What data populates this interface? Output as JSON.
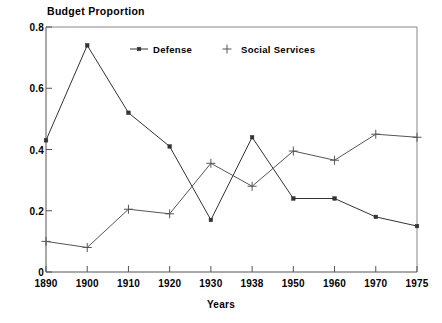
{
  "chart_data": {
    "type": "line",
    "title": "",
    "xlabel": "Years",
    "ylabel": "Budget Proportion",
    "categories": [
      "1890",
      "1900",
      "1910",
      "1920",
      "1930",
      "1938",
      "1950",
      "1960",
      "1970",
      "1975"
    ],
    "series": [
      {
        "name": "Defense",
        "marker": "square-dot",
        "color": "#333333",
        "values": [
          0.43,
          0.74,
          0.52,
          0.41,
          0.17,
          0.44,
          0.24,
          0.24,
          0.18,
          0.15
        ]
      },
      {
        "name": "Social Services",
        "marker": "plus",
        "color": "#555555",
        "values": [
          0.1,
          0.08,
          0.205,
          0.19,
          0.355,
          0.28,
          0.395,
          0.365,
          0.45,
          0.44
        ]
      }
    ],
    "ylim": [
      0,
      0.8
    ],
    "yticks": [
      "0",
      "0.2",
      "0.4",
      "0.6",
      "0.8"
    ],
    "ytick_values": [
      0,
      0.2,
      0.4,
      0.6,
      0.8
    ],
    "grid": false,
    "legend_position": "top-center"
  },
  "axes": {
    "y_title": "Budget Proportion",
    "x_title": "Years"
  },
  "legend": {
    "entries": [
      {
        "label": "Defense"
      },
      {
        "label": "Social Services"
      }
    ]
  }
}
